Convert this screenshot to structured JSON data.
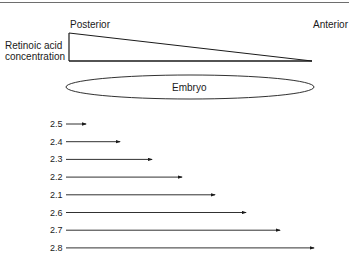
{
  "diagram": {
    "gradient": {
      "ylabel_line1": "Retinoic acid",
      "ylabel_line2": "concentration",
      "left_label": "Posterior",
      "right_label": "Anterior"
    },
    "embryo_label": "Embryo",
    "arrows": [
      {
        "label": "2.5",
        "end_x": 86
      },
      {
        "label": "2.4",
        "end_x": 120
      },
      {
        "label": "2.3",
        "end_x": 152
      },
      {
        "label": "2.2",
        "end_x": 182
      },
      {
        "label": "2.1",
        "end_x": 215
      },
      {
        "label": "2.6",
        "end_x": 246
      },
      {
        "label": "2.7",
        "end_x": 280
      },
      {
        "label": "2.8",
        "end_x": 314
      }
    ]
  }
}
